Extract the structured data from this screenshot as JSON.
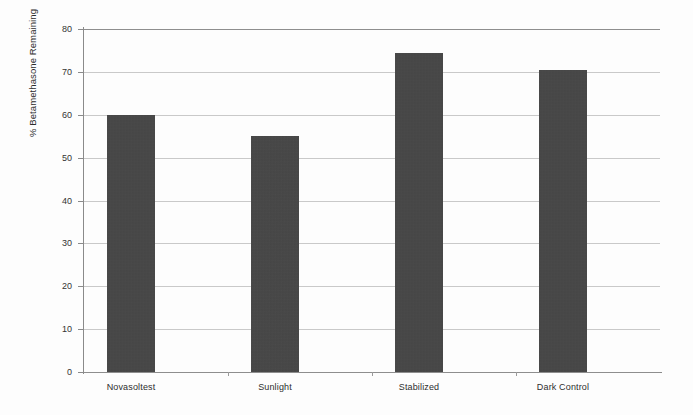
{
  "chart_data": {
    "type": "bar",
    "title": "",
    "xlabel": "",
    "ylabel": "% Betamethasone Remaining",
    "categories": [
      "Novasoltest",
      "Sunlight",
      "Stabilized",
      "Dark Control"
    ],
    "values": [
      60,
      55,
      74.5,
      70.5
    ],
    "ylim": [
      0,
      80
    ],
    "ytick_values": [
      0,
      10,
      20,
      30,
      40,
      50,
      60,
      70,
      80
    ],
    "ytick_labels": [
      "0",
      "10",
      "20",
      "30",
      "40",
      "50",
      "60",
      "70",
      "80"
    ],
    "grid": true,
    "legend": null,
    "legend_position": "none",
    "series": [
      {
        "name": "% Betamethasone Remaining",
        "values": [
          60,
          55,
          74.5,
          70.5
        ],
        "color": "#434343"
      }
    ]
  },
  "style": {
    "bar_color": "#434343",
    "grid_color": "#c9c9c9",
    "axis_color": "#8a8a8a",
    "text_color": "#2e2e2e",
    "background": "#fdfdfd"
  }
}
